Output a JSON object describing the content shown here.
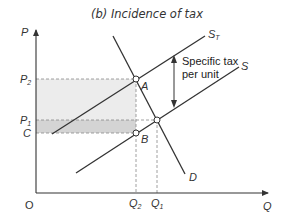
{
  "title": "(b) Incidence of tax",
  "axes": {
    "y_label": "P",
    "x_label": "Q",
    "origin_label": "O"
  },
  "price_labels": {
    "p2": {
      "base": "P",
      "sub": "2"
    },
    "p1": {
      "base": "P",
      "sub": "1"
    },
    "c": "C"
  },
  "quantity_labels": {
    "q2": {
      "base": "Q",
      "sub": "2"
    },
    "q1": {
      "base": "Q",
      "sub": "1"
    }
  },
  "curves": {
    "supply_taxed": {
      "base": "S",
      "sub": "T"
    },
    "supply": "S",
    "demand": "D"
  },
  "points": {
    "a": "A",
    "b": "B"
  },
  "annotation": {
    "line1": "Specific tax",
    "line2": "per unit"
  },
  "colors": {
    "line": "#333333",
    "guide": "#888888",
    "shade_light": "#ececec",
    "shade_dark": "#d4d4d4"
  }
}
